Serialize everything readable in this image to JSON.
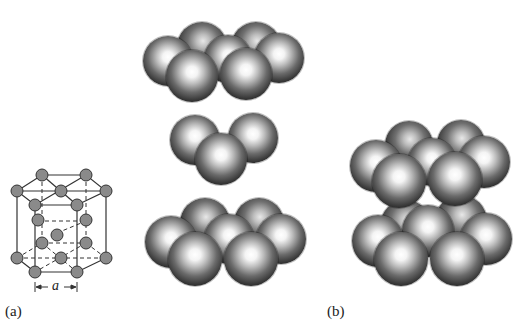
{
  "figure": {
    "panel_a": {
      "label": "(a)",
      "lattice_param_label": "a",
      "description": "hexagonal close-packed unit cell"
    },
    "panel_b": {
      "label": "(b)",
      "description": "hard-sphere HCP stacking"
    },
    "layers": [
      "top",
      "middle",
      "bottom"
    ]
  }
}
